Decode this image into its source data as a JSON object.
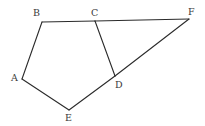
{
  "figure": {
    "background_color": "#ffffff",
    "stroke_color": "#2b2b2b",
    "label_color": "#3a3a3a",
    "stroke_width": 1.1,
    "canvas": {
      "width": 205,
      "height": 126
    },
    "vertices": [
      {
        "name": "A",
        "label": "A",
        "x": 22,
        "y": 79,
        "label_x": 11,
        "label_y": 73
      },
      {
        "name": "B",
        "label": "B",
        "x": 42,
        "y": 22,
        "label_x": 33,
        "label_y": 8
      },
      {
        "name": "C",
        "label": "C",
        "x": 95,
        "y": 21,
        "label_x": 91,
        "label_y": 8
      },
      {
        "name": "D",
        "label": "D",
        "x": 115,
        "y": 76,
        "label_x": 115,
        "label_y": 80
      },
      {
        "name": "E",
        "label": "E",
        "x": 69,
        "y": 110,
        "label_x": 65,
        "label_y": 113
      },
      {
        "name": "F",
        "label": "F",
        "x": 189,
        "y": 19,
        "label_x": 188,
        "label_y": 7
      }
    ],
    "edges": [
      {
        "name": "edge-A-B",
        "from": "A",
        "to": "B"
      },
      {
        "name": "edge-B-C",
        "from": "B",
        "to": "C"
      },
      {
        "name": "edge-C-F",
        "from": "C",
        "to": "F"
      },
      {
        "name": "edge-C-D",
        "from": "C",
        "to": "D"
      },
      {
        "name": "edge-D-F",
        "from": "D",
        "to": "F"
      },
      {
        "name": "edge-D-E",
        "from": "D",
        "to": "E"
      },
      {
        "name": "edge-E-A",
        "from": "E",
        "to": "A"
      }
    ]
  }
}
